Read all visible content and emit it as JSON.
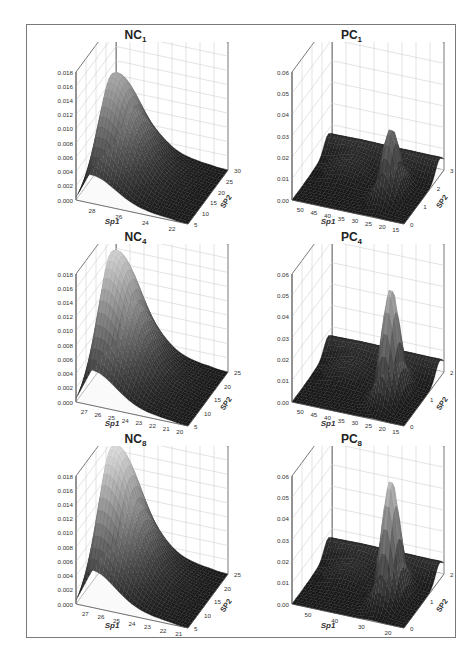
{
  "chart_data": [
    {
      "type": "surface3d",
      "title": "NC1",
      "title_main": "NC",
      "title_sub": "1",
      "xlabel": "Sp1",
      "ylabel": "SP2",
      "zlim": [
        0,
        0.018
      ],
      "z_ticks": [
        "0.000",
        "0.002",
        "0.004",
        "0.006",
        "0.008",
        "0.010",
        "0.012",
        "0.014",
        "0.016",
        "0.018"
      ],
      "x_ticks": [
        "28",
        "26",
        "24",
        "22"
      ],
      "y_ticks": [
        "5",
        "10",
        "15",
        "20",
        "25",
        "30"
      ],
      "peak_z": 0.014,
      "grid": true
    },
    {
      "type": "surface3d",
      "title": "PC1",
      "title_main": "PC",
      "title_sub": "1",
      "xlabel": "Sp1",
      "ylabel": "SP2",
      "zlim": [
        0,
        0.06
      ],
      "z_ticks": [
        "0.00",
        "0.01",
        "0.02",
        "0.03",
        "0.04",
        "0.05",
        "0.06"
      ],
      "x_ticks": [
        "50",
        "45",
        "40",
        "35",
        "30",
        "25",
        "20",
        "15"
      ],
      "y_ticks": [
        "0",
        "1",
        "2",
        "3"
      ],
      "peak_z": 0.03,
      "grid": true
    },
    {
      "type": "surface3d",
      "title": "NC4",
      "title_main": "NC",
      "title_sub": "4",
      "xlabel": "Sp1",
      "ylabel": "SP2",
      "zlim": [
        0,
        0.018
      ],
      "z_ticks": [
        "0.000",
        "0.002",
        "0.004",
        "0.006",
        "0.008",
        "0.010",
        "0.012",
        "0.014",
        "0.016",
        "0.018"
      ],
      "x_ticks": [
        "27",
        "26",
        "25",
        "24",
        "23",
        "22",
        "21",
        "20"
      ],
      "y_ticks": [
        "5",
        "10",
        "15",
        "20",
        "25"
      ],
      "peak_z": 0.0175,
      "grid": true
    },
    {
      "type": "surface3d",
      "title": "PC4",
      "title_main": "PC",
      "title_sub": "4",
      "xlabel": "Sp1",
      "ylabel": "SP2",
      "zlim": [
        0,
        0.06
      ],
      "z_ticks": [
        "0.00",
        "0.01",
        "0.02",
        "0.03",
        "0.04",
        "0.05",
        "0.06"
      ],
      "x_ticks": [
        "50",
        "45",
        "40",
        "35",
        "30",
        "25",
        "20",
        "15"
      ],
      "y_ticks": [
        "0",
        "1",
        "2"
      ],
      "peak_z": 0.05,
      "grid": true
    },
    {
      "type": "surface3d",
      "title": "NC8",
      "title_main": "NC",
      "title_sub": "8",
      "xlabel": "Sp1",
      "ylabel": "SP2",
      "zlim": [
        0,
        0.018
      ],
      "z_ticks": [
        "0.000",
        "0.002",
        "0.004",
        "0.006",
        "0.008",
        "0.010",
        "0.012",
        "0.014",
        "0.016",
        "0.018"
      ],
      "x_ticks": [
        "27",
        "26",
        "25",
        "24",
        "23",
        "22",
        "21"
      ],
      "y_ticks": [
        "5",
        "10",
        "15",
        "20",
        "25"
      ],
      "peak_z": 0.0185,
      "grid": true
    },
    {
      "type": "surface3d",
      "title": "PC8",
      "title_main": "PC",
      "title_sub": "8",
      "xlabel": "Sp1",
      "ylabel": "SP2",
      "zlim": [
        0,
        0.06
      ],
      "z_ticks": [
        "0.00",
        "0.01",
        "0.02",
        "0.03",
        "0.04",
        "0.05",
        "0.06"
      ],
      "x_ticks": [
        "50",
        "40",
        "30",
        "20"
      ],
      "y_ticks": [
        "0",
        "1",
        "2"
      ],
      "peak_z": 0.055,
      "grid": true
    }
  ],
  "colors": {
    "surface_dark": "#1a1a1a",
    "surface_light": "#d8d8d8",
    "grid": "#d0d0d0",
    "axis": "#555555",
    "frame": "#7a7a7a"
  }
}
